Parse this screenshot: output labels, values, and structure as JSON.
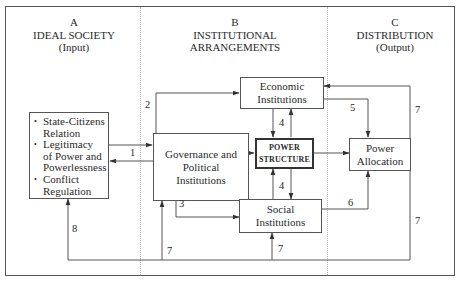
{
  "columns": [
    {
      "letter": "A",
      "title": "IDEAL SOCIETY",
      "subtitle": "(Input)"
    },
    {
      "letter": "B",
      "title_line1": "INSTITUTIONAL",
      "title_line2": "ARRANGEMENTS"
    },
    {
      "letter": "C",
      "title": "DISTRIBUTION",
      "subtitle": "(Output)"
    }
  ],
  "boxes": {
    "ideal_society_items": [
      "State-Citizens Relation",
      "Legitimacy of Power and Powerlessness",
      "Conflict Regulation"
    ],
    "ideal_society_lines": [
      [
        "State-Citizens",
        "Relation"
      ],
      [
        "Legitimacy",
        "of Power and",
        "Powerlessness"
      ],
      [
        "Conflict",
        "Regulation"
      ]
    ],
    "governance": [
      "Governance and",
      "Political",
      "Institutions"
    ],
    "economic": [
      "Economic",
      "Institutions"
    ],
    "power_structure": [
      "POWER",
      "STRUCTURE"
    ],
    "social": [
      "Social",
      "Institutions"
    ],
    "power_allocation": [
      "Power",
      "Allocation"
    ]
  },
  "edge_labels": {
    "e1": "1",
    "e2": "2",
    "e3": "3",
    "e4_top": "4",
    "e4_bottom": "4",
    "e5": "5",
    "e6": "6",
    "e7_right_top": "7",
    "e7_right_bottom": "7",
    "e7_social": "7",
    "e7_governance": "7",
    "e8": "8"
  }
}
